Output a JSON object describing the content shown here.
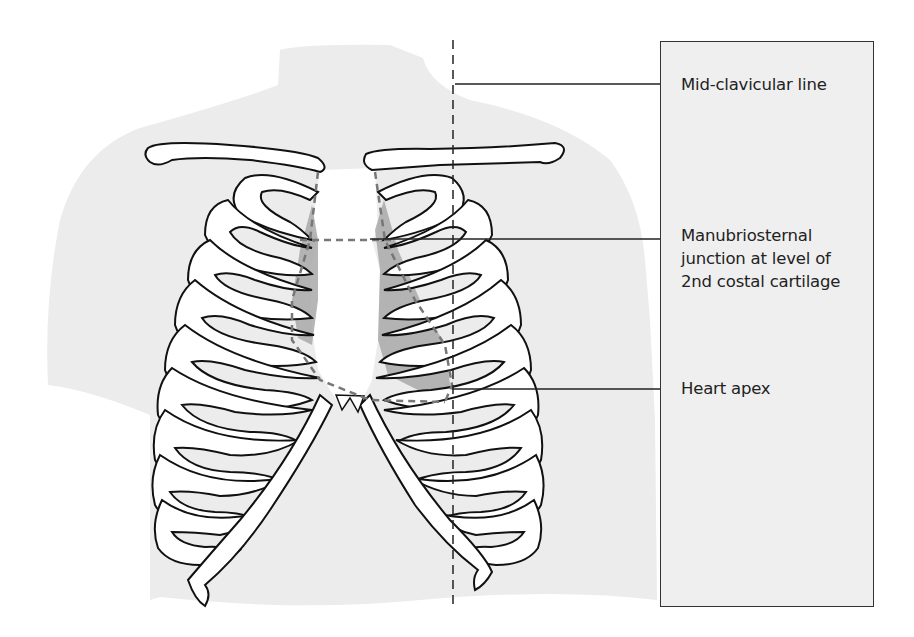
{
  "figure": {
    "labels": [
      {
        "id": "mid-clavicular",
        "text": "Mid-clavicular line"
      },
      {
        "id": "manubriosternal",
        "text": "Manubriosternal\njunction at level of\n2nd costal cartilage"
      },
      {
        "id": "heart-apex",
        "text": "Heart apex"
      }
    ]
  },
  "colors": {
    "torso_fill": "#ececec",
    "label_box_fill": "#efefef",
    "bone_fill": "#ffffff",
    "outline": "#111111",
    "heart_shade": "#a9a9a9",
    "dashed_line": "#333333"
  }
}
